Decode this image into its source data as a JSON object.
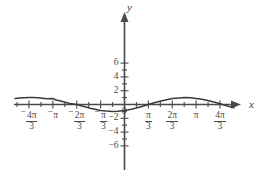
{
  "figure": {
    "background_color": "#ffffff",
    "ink_color": "#4a4a4a",
    "axis_names": {
      "x": "x",
      "y": "y"
    }
  },
  "chart_data": {
    "type": "line",
    "title": "",
    "subtitle": "",
    "xlabel": "x",
    "ylabel": "y",
    "grid": false,
    "legend": "none",
    "xlim": [
      -4.8,
      4.8
    ],
    "ylim": [
      -6.5,
      6.5
    ],
    "x_tick_labels": [
      {
        "value": -4.18879,
        "text": "-4π/3",
        "sign": "−",
        "numerator": "4π",
        "denominator": "3"
      },
      {
        "value": -3.14159,
        "text": "-π",
        "sign": "−",
        "numerator": "π",
        "denominator": ""
      },
      {
        "value": -2.0944,
        "text": "-2π/3",
        "sign": "−",
        "numerator": "2π",
        "denominator": "3"
      },
      {
        "value": -1.0472,
        "text": "-π/3",
        "sign": "−",
        "numerator": "π",
        "denominator": "3"
      },
      {
        "value": 1.0472,
        "text": "π/3",
        "sign": "",
        "numerator": "π",
        "denominator": "3"
      },
      {
        "value": 2.0944,
        "text": "2π/3",
        "sign": "",
        "numerator": "2π",
        "denominator": "3"
      },
      {
        "value": 3.14159,
        "text": "π",
        "sign": "",
        "numerator": "π",
        "denominator": ""
      },
      {
        "value": 4.18879,
        "text": "4π/3",
        "sign": "",
        "numerator": "4π",
        "denominator": "3"
      }
    ],
    "x_minor_tick_values": [
      -4.71239,
      -3.66519,
      -2.61799,
      -1.5708,
      -0.5236,
      0.5236,
      1.5708,
      2.61799,
      3.66519,
      4.71239
    ],
    "y_tick_labels": [
      {
        "value": 6,
        "text": "6"
      },
      {
        "value": 4,
        "text": "4"
      },
      {
        "value": 2,
        "text": "2"
      },
      {
        "value": 0,
        "text": "0"
      },
      {
        "value": -2,
        "text": "-2"
      },
      {
        "value": -4,
        "text": "-4"
      },
      {
        "value": -6,
        "text": "-6"
      }
    ],
    "y_minor_tick_values": [
      5,
      3,
      1,
      -1,
      -3,
      -5
    ],
    "series": [
      {
        "name": "curve",
        "equation": "y = -cos(x + pi/6)",
        "amplitude": 1,
        "period": 6.28319,
        "phase_shift": -0.5236,
        "color": "#3a3a3a",
        "points": [
          {
            "x": -4.8,
            "y": 0.87
          },
          {
            "x": -4.6,
            "y": 0.94
          },
          {
            "x": -4.4,
            "y": 0.98
          },
          {
            "x": -4.18879,
            "y": 1.0
          },
          {
            "x": -4.0,
            "y": 1.0
          },
          {
            "x": -3.8,
            "y": 0.97
          },
          {
            "x": -3.6,
            "y": 0.91
          },
          {
            "x": -3.4,
            "y": 0.82
          },
          {
            "x": -3.14159,
            "y": 0.87
          },
          {
            "x": -3.0,
            "y": 0.66
          },
          {
            "x": -2.8,
            "y": 0.51
          },
          {
            "x": -2.6,
            "y": 0.34
          },
          {
            "x": -2.4,
            "y": 0.16
          },
          {
            "x": -2.0944,
            "y": 0.0
          },
          {
            "x": -1.9,
            "y": -0.19
          },
          {
            "x": -1.7,
            "y": -0.37
          },
          {
            "x": -1.5,
            "y": -0.54
          },
          {
            "x": -1.3,
            "y": -0.69
          },
          {
            "x": -1.0472,
            "y": -0.87
          },
          {
            "x": -0.8,
            "y": -0.95
          },
          {
            "x": -0.5236,
            "y": -1.0
          },
          {
            "x": -0.3,
            "y": -0.98
          },
          {
            "x": 0.0,
            "y": -0.87
          },
          {
            "x": 0.3,
            "y": -0.68
          },
          {
            "x": 0.6,
            "y": -0.43
          },
          {
            "x": 0.8,
            "y": -0.26
          },
          {
            "x": 1.0472,
            "y": 0.0
          },
          {
            "x": 1.3,
            "y": 0.24
          },
          {
            "x": 1.6,
            "y": 0.51
          },
          {
            "x": 1.9,
            "y": 0.73
          },
          {
            "x": 2.0944,
            "y": 0.87
          },
          {
            "x": 2.4,
            "y": 0.96
          },
          {
            "x": 2.61799,
            "y": 1.0
          },
          {
            "x": 2.9,
            "y": 0.97
          },
          {
            "x": 3.14159,
            "y": 0.87
          },
          {
            "x": 3.4,
            "y": 0.75
          },
          {
            "x": 3.7,
            "y": 0.54
          },
          {
            "x": 4.0,
            "y": 0.28
          },
          {
            "x": 4.18879,
            "y": 0.1
          },
          {
            "x": 4.4,
            "y": -0.11
          },
          {
            "x": 4.6,
            "y": -0.3
          },
          {
            "x": 4.8,
            "y": -0.47
          }
        ]
      }
    ]
  }
}
